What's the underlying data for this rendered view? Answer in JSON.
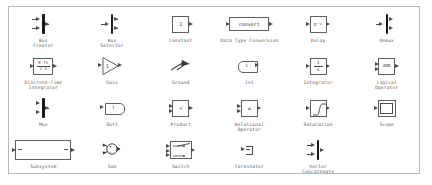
{
  "palette": {
    "name": "simulink-library-palette",
    "border_color": "#b9b9b9",
    "background": "#ffffff",
    "label_color": "#5a5a5a",
    "block_stroke": "#5f5f5f",
    "rows": [
      {
        "row_index": 0,
        "blocks": [
          {
            "name": "bus-creator",
            "label": "Bus\nCreator",
            "glyph": "bus-bar",
            "inner_text": "",
            "ports_in": 2,
            "ports_out": 1
          },
          {
            "name": "bus-selector",
            "label": "Bus\nSelector",
            "glyph": "bus-bar",
            "inner_text": "",
            "ports_in": 1,
            "ports_out": 2
          },
          {
            "name": "constant",
            "label": "Constant",
            "glyph": "square-box",
            "inner_text": "1",
            "ports_in": 0,
            "ports_out": 1
          },
          {
            "name": "data-type-conversion",
            "label": "Data Type Conversion",
            "glyph": "wide-box",
            "inner_text": "convert",
            "ports_in": 1,
            "ports_out": 1
          },
          {
            "name": "delay",
            "label": "Delay",
            "glyph": "square-box",
            "inner_text": "z⁻¹",
            "ports_in": 1,
            "ports_out": 1
          },
          {
            "name": "demux",
            "label": "Demux",
            "glyph": "bus-bar",
            "inner_text": "",
            "ports_in": 1,
            "ports_out": 2
          }
        ]
      },
      {
        "row_index": 1,
        "blocks": [
          {
            "name": "discrete-time-integrator",
            "label": "Discrete-Time\nIntegrator",
            "glyph": "fraction-box",
            "inner_text": "K Ts\nz-1",
            "numerator": "K Ts",
            "denominator": "z-1",
            "ports_in": 1,
            "ports_out": 1
          },
          {
            "name": "gain",
            "label": "Gain",
            "glyph": "triangle",
            "inner_text": "1",
            "ports_in": 1,
            "ports_out": 1
          },
          {
            "name": "ground",
            "label": "Ground",
            "glyph": "ground-arrow",
            "inner_text": "",
            "ports_in": 0,
            "ports_out": 1
          },
          {
            "name": "in1",
            "label": "In1",
            "glyph": "inport",
            "inner_text": "1",
            "ports_in": 0,
            "ports_out": 1
          },
          {
            "name": "integrator",
            "label": "Integrator",
            "glyph": "fraction-box",
            "inner_text": "1\ns",
            "numerator": "1",
            "denominator": "s",
            "ports_in": 1,
            "ports_out": 1
          },
          {
            "name": "logical-operator",
            "label": "Logical\nOperator",
            "glyph": "square-box",
            "inner_text": "AND",
            "ports_in": 2,
            "ports_out": 1
          }
        ]
      },
      {
        "row_index": 2,
        "blocks": [
          {
            "name": "mux",
            "label": "Mux",
            "glyph": "bus-bar",
            "inner_text": "",
            "ports_in": 2,
            "ports_out": 1
          },
          {
            "name": "out1",
            "label": "Out1",
            "glyph": "outport",
            "inner_text": "1",
            "ports_in": 1,
            "ports_out": 0
          },
          {
            "name": "product",
            "label": "Product",
            "glyph": "square-box",
            "inner_text": "×",
            "ports_in": 2,
            "ports_out": 1
          },
          {
            "name": "relational-operator",
            "label": "Relational\nOperator",
            "glyph": "square-box",
            "inner_text": "≤",
            "ports_in": 2,
            "ports_out": 1
          },
          {
            "name": "saturation",
            "label": "Saturation",
            "glyph": "saturation-curve",
            "inner_text": "",
            "ports_in": 1,
            "ports_out": 1
          },
          {
            "name": "scope",
            "label": "Scope",
            "glyph": "scope-screen",
            "inner_text": "",
            "ports_in": 1,
            "ports_out": 0
          }
        ]
      },
      {
        "row_index": 3,
        "blocks": [
          {
            "name": "subsystem",
            "label": "Subsystem",
            "glyph": "wide-rect",
            "inner_text": "",
            "ports_in": 1,
            "ports_out": 1
          },
          {
            "name": "sum",
            "label": "Sum",
            "glyph": "sum-circle",
            "inner_text": "+ −",
            "ports_in": 2,
            "ports_out": 1
          },
          {
            "name": "switch",
            "label": "Switch",
            "glyph": "switch-box",
            "inner_text": "",
            "ports_in": 3,
            "ports_out": 1
          },
          {
            "name": "terminator",
            "label": "Terminator",
            "glyph": "terminator",
            "inner_text": "",
            "ports_in": 1,
            "ports_out": 0
          },
          {
            "name": "vector-concatenate",
            "label": "Vector\nConcatenate",
            "glyph": "bus-bar",
            "inner_text": "",
            "ports_in": 2,
            "ports_out": 1
          },
          {
            "name": "empty-slot",
            "label": "",
            "glyph": "none",
            "inner_text": "",
            "ports_in": 0,
            "ports_out": 0
          }
        ]
      }
    ]
  }
}
